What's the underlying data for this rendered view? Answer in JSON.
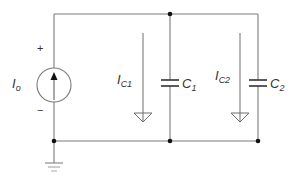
{
  "diagram": {
    "type": "circuit-schematic",
    "source": {
      "label": "I",
      "subscript": "o",
      "plus_sign": "+",
      "minus_sign": "−"
    },
    "branches": [
      {
        "current_label": "I",
        "current_subscript": "C1",
        "capacitor_label": "C",
        "capacitor_subscript": "1"
      },
      {
        "current_label": "I",
        "current_subscript": "C2",
        "capacitor_label": "C",
        "capacitor_subscript": "2"
      }
    ],
    "colors": {
      "wire": "#7a7a7a",
      "node": "#111111",
      "text": "#333333"
    }
  }
}
